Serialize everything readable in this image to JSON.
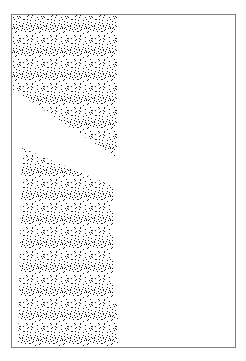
{
  "figure": {
    "canvas": {
      "width": 246,
      "height": 361,
      "background_color": "#ffffff"
    },
    "frame": {
      "name": "border-frame",
      "x": 11,
      "y": 14,
      "width": 224,
      "height": 333,
      "stroke_color": "#808080",
      "stroke_width": 1,
      "fill": "none"
    },
    "texture": {
      "style": "random-stipple-dither",
      "dot_color": "#1a1a1a",
      "background_color": "#ffffff",
      "density": 0.45,
      "dot_size": 1,
      "cell": 2
    },
    "shapes": [
      {
        "name": "upper-stipple-shape",
        "kind": "quadrilateral",
        "description": "Upper wedge: flush with the top and left frame edges, with a long diagonal cutting from the left edge down to the lower right corner.",
        "points": "12,15 117,15 117,158 12,89",
        "vertices": [
          {
            "x": 12,
            "y": 15
          },
          {
            "x": 117,
            "y": 15
          },
          {
            "x": 117,
            "y": 158
          },
          {
            "x": 12,
            "y": 89
          }
        ]
      },
      {
        "name": "lower-stipple-shape",
        "kind": "polygon",
        "description": "Lower block: top edge slopes down to the right, right edge steps slightly outward near the bottom, bottom edge rests on the frame base.",
        "points": "22,148 113,186 113,300 118,306 118,347 18,347",
        "vertices": [
          {
            "x": 22,
            "y": 148
          },
          {
            "x": 113,
            "y": 186
          },
          {
            "x": 113,
            "y": 300
          },
          {
            "x": 118,
            "y": 306
          },
          {
            "x": 118,
            "y": 347
          },
          {
            "x": 18,
            "y": 347
          }
        ]
      }
    ]
  }
}
